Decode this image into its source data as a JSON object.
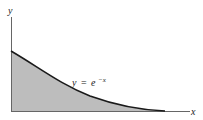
{
  "diagram": {
    "type": "function-area",
    "function_label": {
      "lhs": "y",
      "eq": "=",
      "base": "e",
      "exponent": "−x"
    },
    "axes": {
      "x_label": "x",
      "y_label": "y"
    },
    "colors": {
      "fill": "#bdbdbd",
      "curve": "#1a1a1a",
      "axis": "#555555"
    }
  }
}
